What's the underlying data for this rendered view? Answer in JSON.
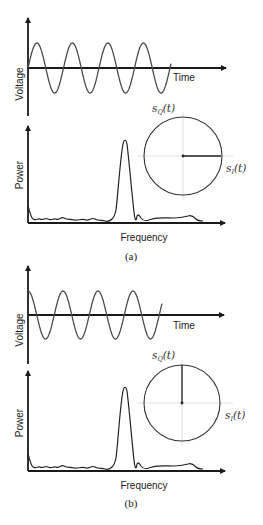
{
  "figure": {
    "panels": [
      {
        "caption": "(a)",
        "time_plot": {
          "ylabel": "Voltage",
          "xlabel": "Time",
          "waveform": "sine",
          "phase_deg": 0,
          "cycles": 4
        },
        "spectrum_plot": {
          "ylabel": "Power",
          "xlabel": "Frequency"
        },
        "constellation": {
          "q_label": "s",
          "q_sub": "Q",
          "q_arg": "(t)",
          "i_label": "s",
          "i_sub": "I",
          "i_arg": "(t)",
          "phasor_angle_deg": 0
        }
      },
      {
        "caption": "(b)",
        "time_plot": {
          "ylabel": "Voltage",
          "xlabel": "Time",
          "waveform": "cosine",
          "phase_deg": 90,
          "cycles": 4
        },
        "spectrum_plot": {
          "ylabel": "Power",
          "xlabel": "Frequency"
        },
        "constellation": {
          "q_label": "s",
          "q_sub": "Q",
          "q_arg": "(t)",
          "i_label": "s",
          "i_sub": "I",
          "i_arg": "(t)",
          "phasor_angle_deg": 90
        }
      }
    ],
    "colors": {
      "axis": "#1a1a1a",
      "waveform": "#4a4a4a",
      "guide": "#d8d8d8"
    }
  }
}
